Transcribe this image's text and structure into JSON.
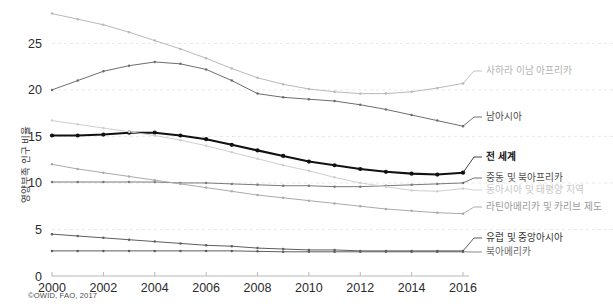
{
  "source_note": "©OWID, FAO, 2017",
  "chart_data": {
    "type": "line",
    "title": "",
    "xlabel": "",
    "ylabel": "영양부족 인구 비율",
    "xlim": [
      2000,
      2016
    ],
    "ylim": [
      0,
      28.8
    ],
    "grid": true,
    "legend_position": "right-inline",
    "x": [
      2000,
      2001,
      2002,
      2003,
      2004,
      2005,
      2006,
      2007,
      2008,
      2009,
      2010,
      2011,
      2012,
      2013,
      2014,
      2015,
      2016
    ],
    "xticks": [
      2000,
      2002,
      2004,
      2006,
      2008,
      2010,
      2012,
      2014,
      2016
    ],
    "yticks": [
      0,
      5,
      10,
      15,
      20,
      25
    ],
    "series": [
      {
        "name": "사하라 이남 아프리카",
        "color": "#b9b9b9",
        "width": 1.0,
        "label_color": "#b3b3b3",
        "values": [
          28.2,
          27.6,
          27.0,
          26.2,
          25.3,
          24.4,
          23.4,
          22.3,
          21.3,
          20.6,
          20.1,
          19.8,
          19.6,
          19.6,
          19.8,
          20.2,
          20.7
        ]
      },
      {
        "name": "남아시아",
        "color": "#6e6e6e",
        "width": 1.0,
        "label_color": "#4d4d4d",
        "values": [
          20.0,
          21.0,
          22.0,
          22.6,
          23.0,
          22.8,
          22.2,
          21.0,
          19.6,
          19.2,
          19.0,
          18.8,
          18.4,
          17.9,
          17.3,
          16.7,
          16.1
        ]
      },
      {
        "name": "전 세계",
        "color": "#111111",
        "width": 2.1,
        "label_color": "#111111",
        "bold": true,
        "values": [
          15.1,
          15.1,
          15.2,
          15.4,
          15.4,
          15.1,
          14.7,
          14.1,
          13.5,
          12.9,
          12.3,
          11.9,
          11.5,
          11.2,
          11.0,
          10.9,
          11.1
        ]
      },
      {
        "name": "중동 및 북아프리카",
        "color": "#7a7a7a",
        "width": 1.0,
        "label_color": "#4d4d4d",
        "values": [
          10.1,
          10.1,
          10.1,
          10.1,
          10.1,
          10.0,
          10.0,
          9.9,
          9.8,
          9.7,
          9.7,
          9.6,
          9.6,
          9.7,
          9.8,
          9.9,
          10.0
        ]
      },
      {
        "name": "동아시아 및 태평양 지역",
        "color": "#cfcfcf",
        "width": 1.0,
        "label_color": "#c6c6c6",
        "values": [
          16.7,
          16.3,
          15.9,
          15.5,
          15.1,
          14.6,
          14.0,
          13.3,
          12.6,
          11.9,
          11.3,
          10.6,
          10.0,
          9.6,
          9.2,
          9.1,
          9.4
        ]
      },
      {
        "name": "라틴아메리카 및 카리브 제도",
        "color": "#aaaaaa",
        "width": 1.0,
        "label_color": "#9b9b9b",
        "values": [
          12.0,
          11.5,
          11.1,
          10.7,
          10.3,
          9.9,
          9.5,
          9.1,
          8.7,
          8.4,
          8.1,
          7.8,
          7.5,
          7.2,
          7.0,
          6.8,
          6.7
        ]
      },
      {
        "name": "유럽 및 중앙아시아",
        "color": "#5e5e5e",
        "width": 1.0,
        "label_color": "#333333",
        "values": [
          4.5,
          4.3,
          4.1,
          3.9,
          3.7,
          3.5,
          3.3,
          3.2,
          3.0,
          2.9,
          2.8,
          2.8,
          2.7,
          2.7,
          2.7,
          2.7,
          2.7
        ]
      },
      {
        "name": "북아메리카",
        "color": "#5e5e5e",
        "width": 1.0,
        "label_color": "#6b6b6b",
        "values": [
          2.7,
          2.7,
          2.7,
          2.7,
          2.7,
          2.7,
          2.7,
          2.7,
          2.65,
          2.6,
          2.6,
          2.6,
          2.6,
          2.6,
          2.6,
          2.6,
          2.6
        ]
      }
    ],
    "label_anchors": [
      {
        "name": "사하라 이남 아프리카",
        "y": 71,
        "lead_from": 463,
        "lead_to": 482
      },
      {
        "name": "남아시아",
        "y": 117,
        "lead_from": 463,
        "lead_to": 482
      },
      {
        "name": "전 세계",
        "y": 157,
        "lead_from": 463,
        "lead_to": 482
      },
      {
        "name": "중동 및 북아프리카",
        "y": 178,
        "lead_from": 463,
        "lead_to": 482
      },
      {
        "name": "동아시아 및 태평양 지역",
        "y": 190,
        "lead_from": 463,
        "lead_to": 482
      },
      {
        "name": "라틴아메리카 및 카리브 제도",
        "y": 207,
        "lead_from": 463,
        "lead_to": 482
      },
      {
        "name": "유럽 및 중앙아시아",
        "y": 238,
        "lead_from": 463,
        "lead_to": 482
      },
      {
        "name": "북아메리카",
        "y": 252,
        "lead_from": 463,
        "lead_to": 482
      }
    ]
  }
}
